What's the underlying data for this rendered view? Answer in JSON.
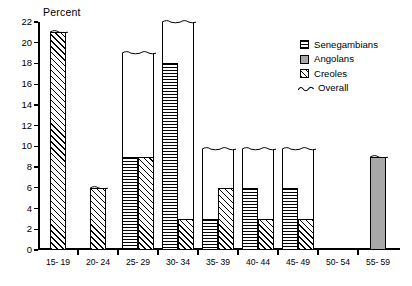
{
  "chart_data": {
    "type": "bar",
    "title": "",
    "subtitle": "",
    "ylabel": "Percent",
    "xlabel": "",
    "ylim": [
      0,
      22
    ],
    "ytick_values": [
      0,
      2,
      4,
      6,
      8,
      10,
      12,
      14,
      16,
      18,
      20,
      22
    ],
    "ytick_labels": [
      "0",
      "2",
      "4",
      "6",
      "8",
      "10",
      "12",
      "14",
      "16",
      "18",
      "20",
      "22"
    ],
    "grid": false,
    "legend_position": "top-right",
    "categories": [
      "15- 19",
      "20- 24",
      "25- 29",
      "30- 34",
      "35- 39",
      "40- 44",
      "45- 49",
      "50- 54",
      "55- 59"
    ],
    "series": [
      {
        "name": "Senegambians",
        "pattern": "horizontal-lines",
        "values": [
          null,
          null,
          9,
          18,
          3,
          6,
          6,
          null,
          null
        ]
      },
      {
        "name": "Angolans",
        "pattern": "solid-gray",
        "color": "#a8a8a8",
        "values": [
          null,
          null,
          null,
          null,
          null,
          null,
          null,
          null,
          9
        ]
      },
      {
        "name": "Creoles",
        "pattern": "diagonal-hatch",
        "values": [
          21,
          6,
          9,
          3,
          6,
          3,
          3,
          null,
          null
        ]
      },
      {
        "name": "Overall",
        "pattern": "wavy-line",
        "values": [
          21,
          6,
          19,
          22,
          9.7,
          9.7,
          9.7,
          null,
          9
        ]
      }
    ]
  },
  "legend": {
    "items": [
      {
        "label": "Senegambians",
        "swatch": "senegambians-swatch"
      },
      {
        "label": "Angolans",
        "swatch": "angolans-swatch"
      },
      {
        "label": "Creoles",
        "swatch": "creoles-swatch"
      },
      {
        "label": "Overall",
        "swatch": "overall-wave-swatch"
      }
    ]
  }
}
